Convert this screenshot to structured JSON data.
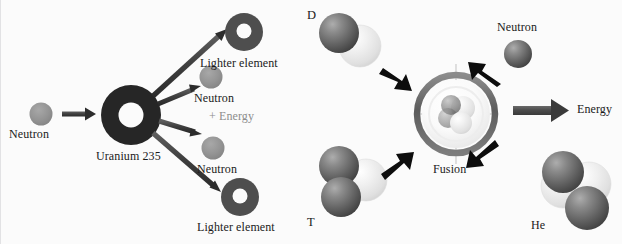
{
  "figure": {
    "background_color": "#fbfbfb"
  },
  "palette": {
    "dark_sphere": "#5a5a5a",
    "dark_sphere_highlight": "#9d9d9d",
    "light_sphere": "#e8e8e8",
    "light_sphere_highlight": "#fdfdfd",
    "nucleus_ring": "#2e2e2e",
    "arrow_gray": "#4a4a4a",
    "arrow_black": "#0d0d0d",
    "energy_text": "#8d8d8d",
    "text": "#1a1a1a",
    "fusion_ring_outer": "#6f6f6f",
    "fusion_ring_inner": "#f2f2f2"
  },
  "fission": {
    "panel_name": "nuclear-fission-diagram",
    "incoming": {
      "label": "Neutron",
      "particle": "neutron-sphere"
    },
    "target": {
      "label": "Uranium 235",
      "particle": "uranium-235-nucleus"
    },
    "products": [
      {
        "label": "Lighter element",
        "particle": "lighter-element-nucleus-top"
      },
      {
        "label": "Neutron",
        "particle": "neutron-sphere-1"
      },
      {
        "label": "Neutron",
        "particle": "neutron-sphere-2"
      },
      {
        "label": "Lighter element",
        "particle": "lighter-element-nucleus-bottom"
      }
    ],
    "energy_label": "+ Energy",
    "arrow_count": 5
  },
  "fusion": {
    "panel_name": "nuclear-fusion-diagram",
    "reactants": [
      {
        "label": "D",
        "name": "deuterium-cluster",
        "spheres": 2
      },
      {
        "label": "T",
        "name": "tritium-cluster",
        "spheres": 3
      }
    ],
    "core": {
      "label": "Fusion",
      "name": "fusion-core"
    },
    "products": [
      {
        "label": "Neutron",
        "name": "neutron-product"
      },
      {
        "label": "Energy",
        "name": "energy-output"
      },
      {
        "label": "He",
        "name": "helium-cluster",
        "spheres": 4
      }
    ]
  }
}
